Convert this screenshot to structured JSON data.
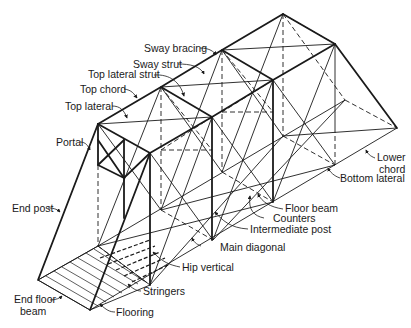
{
  "diagram": {
    "type": "labeled truss bridge isometric drawing",
    "line_color": "#1a1a1a",
    "background": "#ffffff"
  },
  "labels": {
    "sway_bracing": "Sway bracing",
    "sway_strut": "Sway strut",
    "top_lateral_strut": "Top lateral strut",
    "top_chord": "Top chord",
    "top_lateral": "Top lateral",
    "portal": "Portal",
    "end_post": "End post",
    "end_floor_beam_1": "End floor",
    "end_floor_beam_2": "beam",
    "flooring": "Flooring",
    "stringers": "Stringers",
    "hip_vertical": "Hip vertical",
    "main_diagonal": "Main diagonal",
    "intermediate_post": "Intermediate post",
    "counters": "Counters",
    "floor_beam": "Floor beam",
    "bottom_lateral": "Bottom lateral",
    "lower_chord_1": "Lower",
    "lower_chord_2": "chord"
  }
}
